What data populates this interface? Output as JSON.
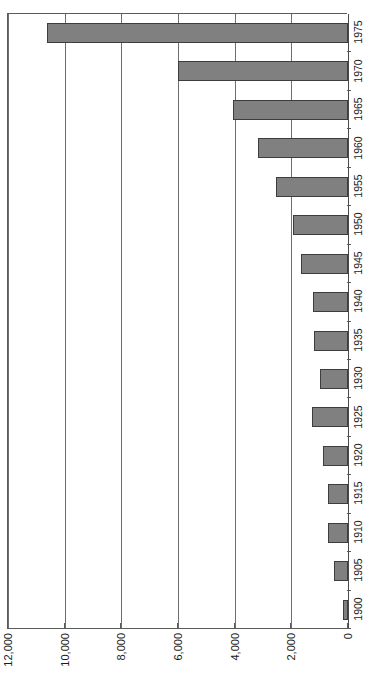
{
  "chart_data": {
    "type": "bar",
    "orientation": "horizontal",
    "title": "",
    "subtitle": "",
    "xlabel": "",
    "ylabel": "",
    "categories": [
      "1975",
      "1970",
      "1965",
      "1960",
      "1955",
      "1950",
      "1945",
      "1940",
      "1935",
      "1930",
      "1925",
      "1920",
      "1915",
      "1910",
      "1905",
      "1900"
    ],
    "values": [
      10620,
      6000,
      4060,
      3180,
      2540,
      1940,
      1660,
      1230,
      1200,
      990,
      1270,
      880,
      710,
      710,
      490,
      180
    ],
    "series": [
      {
        "name": "",
        "values": [
          10620,
          6000,
          4060,
          3180,
          2540,
          1940,
          1660,
          1230,
          1200,
          990,
          1270,
          880,
          710,
          710,
          490,
          180
        ]
      }
    ],
    "value_axis_ticks": [
      {
        "value": 12000,
        "label": "12,000"
      },
      {
        "value": 10000,
        "label": "10,000"
      },
      {
        "value": 8000,
        "label": "8,000"
      },
      {
        "value": 6000,
        "label": "6,000"
      },
      {
        "value": 4000,
        "label": "4,000"
      },
      {
        "value": 2000,
        "label": "2,000"
      },
      {
        "value": 0,
        "label": "0"
      }
    ],
    "xlim": [
      0,
      12000
    ],
    "value_axis_reversed": true,
    "grid": true,
    "legend": false,
    "legend_position": "none",
    "bar_color": "#808080",
    "bar_border_color": "#3d3d3d",
    "gridline_color": "#6e6e6e",
    "axis_color": "#5a5a5a",
    "background_color": "#ffffff"
  }
}
